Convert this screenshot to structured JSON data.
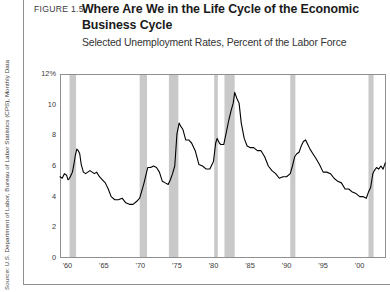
{
  "figure": {
    "number_label": "FIGURE 1.5",
    "title_line_1": "Where Are We in the Life Cycle of the Economic",
    "title_line_2": "Business Cycle",
    "subtitle": "Selected Unemployment Rates, Percent of the Labor Force",
    "source": "Source: U.S. Department of Labor, Bureau of Labor Statistics (CPS), Monthly Data"
  },
  "colors": {
    "line": "#000000",
    "recession_band": "#c9c9c9",
    "plot_border": "#8f8f8f",
    "frame_border": "#8f8f8f",
    "text": "#3b3b3b",
    "title": "#1a1a1a",
    "background": "#ffffff"
  },
  "chart_data": {
    "type": "line",
    "title": "Where Are We in the Life Cycle of the Economic Business Cycle",
    "subtitle": "Selected Unemployment Rates, Percent of the Labor Force",
    "xlabel": "",
    "ylabel": "Percent of the Labor Force",
    "xlim": [
      1959.0,
      2003.6
    ],
    "ylim": [
      0,
      12
    ],
    "yticks": [
      0,
      2,
      4,
      6,
      8,
      10,
      12
    ],
    "ytick_labels": [
      "0",
      "2",
      "4",
      "6",
      "8",
      "10",
      "12%"
    ],
    "xticks": [
      1960,
      1965,
      1970,
      1975,
      1980,
      1985,
      1990,
      1995,
      2000
    ],
    "xtick_labels": [
      "'60",
      "'65",
      "'70",
      "'75",
      "'80",
      "'85",
      "'90",
      "'95",
      "'00"
    ],
    "grid": false,
    "legend": null,
    "series": [
      {
        "name": "Unemployment Rate",
        "x": [
          1959.0,
          1959.3,
          1959.6,
          1959.9,
          1960.1,
          1960.3,
          1960.5,
          1960.7,
          1960.9,
          1961.1,
          1961.3,
          1961.5,
          1961.7,
          1961.9,
          1962.2,
          1962.5,
          1962.8,
          1963.1,
          1963.4,
          1963.7,
          1964.0,
          1964.4,
          1964.8,
          1965.2,
          1965.6,
          1966.0,
          1966.5,
          1967.0,
          1967.5,
          1968.0,
          1968.5,
          1969.0,
          1969.5,
          1969.9,
          1970.2,
          1970.5,
          1970.8,
          1971.0,
          1971.4,
          1971.8,
          1972.2,
          1972.6,
          1973.0,
          1973.4,
          1973.8,
          1974.1,
          1974.4,
          1974.7,
          1975.0,
          1975.3,
          1975.5,
          1975.8,
          1976.2,
          1976.6,
          1977.0,
          1977.5,
          1978.0,
          1978.5,
          1979.0,
          1979.5,
          1980.0,
          1980.3,
          1980.5,
          1980.8,
          1981.0,
          1981.4,
          1981.8,
          1982.1,
          1982.4,
          1982.7,
          1982.9,
          1983.2,
          1983.5,
          1983.8,
          1984.2,
          1984.6,
          1985.0,
          1985.5,
          1986.0,
          1986.5,
          1987.0,
          1987.5,
          1988.0,
          1988.5,
          1989.0,
          1989.5,
          1990.0,
          1990.5,
          1990.8,
          1991.1,
          1991.4,
          1991.7,
          1992.0,
          1992.3,
          1992.6,
          1992.9,
          1993.2,
          1993.6,
          1994.0,
          1994.5,
          1995.0,
          1995.5,
          1996.0,
          1996.5,
          1997.0,
          1997.5,
          1998.0,
          1998.5,
          1999.0,
          1999.5,
          2000.0,
          2000.5,
          2000.9,
          2001.2,
          2001.5,
          2001.8,
          2002.0,
          2002.3,
          2002.6,
          2002.9,
          2003.2,
          2003.5
        ],
        "y": [
          5.3,
          5.2,
          5.5,
          5.4,
          5.1,
          5.2,
          5.4,
          5.6,
          6.1,
          6.7,
          7.1,
          7.0,
          6.8,
          6.1,
          5.6,
          5.5,
          5.6,
          5.7,
          5.6,
          5.5,
          5.6,
          5.3,
          5.1,
          4.9,
          4.5,
          4.0,
          3.8,
          3.8,
          3.9,
          3.6,
          3.5,
          3.5,
          3.7,
          3.9,
          4.4,
          4.9,
          5.5,
          5.9,
          5.9,
          6.0,
          5.9,
          5.6,
          5.0,
          4.9,
          4.8,
          5.1,
          5.5,
          6.0,
          8.1,
          8.8,
          8.6,
          8.4,
          7.7,
          7.7,
          7.5,
          7.0,
          6.1,
          6.0,
          5.8,
          5.8,
          6.3,
          7.5,
          7.8,
          7.5,
          7.4,
          7.4,
          8.3,
          9.0,
          9.6,
          10.1,
          10.8,
          10.4,
          10.1,
          8.8,
          7.8,
          7.3,
          7.2,
          7.2,
          7.0,
          7.0,
          6.6,
          6.0,
          5.7,
          5.5,
          5.2,
          5.3,
          5.3,
          5.5,
          6.0,
          6.6,
          6.8,
          6.9,
          7.3,
          7.6,
          7.7,
          7.4,
          7.1,
          6.8,
          6.5,
          6.1,
          5.6,
          5.6,
          5.5,
          5.2,
          5.0,
          4.9,
          4.5,
          4.5,
          4.3,
          4.2,
          4.0,
          4.0,
          3.9,
          4.3,
          4.6,
          5.5,
          5.7,
          5.9,
          5.8,
          6.0,
          5.8,
          6.2
        ],
        "color": "#000000"
      }
    ],
    "recession_bands": [
      {
        "label": "1960-61 recession",
        "start": 1960.3,
        "end": 1961.2
      },
      {
        "label": "1969-70 recession",
        "start": 1969.9,
        "end": 1970.9
      },
      {
        "label": "1973-75 recession",
        "start": 1973.9,
        "end": 1975.2
      },
      {
        "label": "1980 recession",
        "start": 1980.1,
        "end": 1980.6
      },
      {
        "label": "1981-82 recession",
        "start": 1981.5,
        "end": 1982.9
      },
      {
        "label": "1990-91 recession",
        "start": 1990.5,
        "end": 1991.2
      },
      {
        "label": "2001 recession",
        "start": 2001.2,
        "end": 2001.9
      }
    ]
  }
}
